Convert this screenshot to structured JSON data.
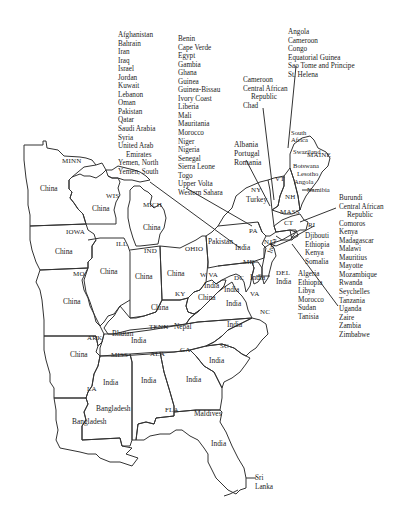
{
  "map": {
    "states": [
      {
        "abbr": "MINN",
        "country": "China"
      },
      {
        "abbr": "WIS",
        "country": "China"
      },
      {
        "abbr": "MICH",
        "country": "China"
      },
      {
        "abbr": "IOWA",
        "country": "China"
      },
      {
        "abbr": "ILL",
        "country": "China"
      },
      {
        "abbr": "IND",
        "country": "China"
      },
      {
        "abbr": "OHIO",
        "country": "China"
      },
      {
        "abbr": "MO",
        "country": "China"
      },
      {
        "abbr": "KY",
        "country": "China"
      },
      {
        "abbr": "ARK",
        "country": "China"
      },
      {
        "abbr": "TENN",
        "country": "Nepal / Bhutan / India"
      },
      {
        "abbr": "MISS",
        "country": "India"
      },
      {
        "abbr": "ALA",
        "country": "India"
      },
      {
        "abbr": "GA",
        "country": "India"
      },
      {
        "abbr": "SC",
        "country": "India"
      },
      {
        "abbr": "NC",
        "country": "India"
      },
      {
        "abbr": "VA",
        "country": "India"
      },
      {
        "abbr": "W VA",
        "country": "India"
      },
      {
        "abbr": "MD",
        "country": "India"
      },
      {
        "abbr": "DC",
        "country": "India"
      },
      {
        "abbr": "DEL",
        "country": "India"
      },
      {
        "abbr": "NJ",
        "country": "India"
      },
      {
        "abbr": "PA",
        "country": "Pakistan / India"
      },
      {
        "abbr": "NY",
        "country": "Turkey"
      },
      {
        "abbr": "VT",
        "country": ""
      },
      {
        "abbr": "NH",
        "country": ""
      },
      {
        "abbr": "MAINE",
        "country": "South Africa / Swaziland / Botswana / Lesotho / Angola"
      },
      {
        "abbr": "MASS",
        "country": ""
      },
      {
        "abbr": "CT",
        "country": ""
      },
      {
        "abbr": "RI",
        "country": ""
      },
      {
        "abbr": "LA",
        "country": "Bangladesh"
      },
      {
        "abbr": "FLA",
        "country": "India / Maldives / Sri Lanka"
      }
    ],
    "state_labels": {
      "minn": "MINN",
      "wis": "WIS",
      "mich": "MICH",
      "iowa": "IOWA",
      "ill": "ILL",
      "ind": "IND",
      "ohio": "OHIO",
      "pa": "PA",
      "ny": "NY",
      "vt": "VT",
      "nh": "NH",
      "maine": "MAINE",
      "mass": "MASS",
      "ct": "CT",
      "ri": "RI",
      "nj": "NJ",
      "del": "DEL",
      "md": "MD",
      "dc": "DC",
      "va": "VA",
      "wva": "W VA",
      "ky": "KY",
      "mo": "MO",
      "tenn": "TENN",
      "nc": "NC",
      "sc": "SC",
      "ga": "GA",
      "ala": "ALA",
      "miss": "MISS",
      "ark": "ARK",
      "la": "LA",
      "fla": "FLA"
    },
    "region_labels": {
      "china_minn": "China",
      "china_wis": "China",
      "china_mich": "China",
      "china_iowa": "China",
      "china_ill": "China",
      "china_ind": "China",
      "china_ohio": "China",
      "china_mo": "China",
      "china_ky": "China",
      "china_ky2": "China",
      "china_ark": "China",
      "pakistan": "Pakistan",
      "india_pa": "India",
      "turkey": "Turkey",
      "india_nj": "India",
      "india_del": "India",
      "india_md": "India",
      "india_wva": "India",
      "india_dc": "India",
      "india_va": "India",
      "india_nc": "India",
      "india_tenn": "India",
      "nepal": "Nepal",
      "bhutan": "Bhutan",
      "india_miss": "India",
      "india_ala": "India",
      "india_ga": "India",
      "india_sc": "India",
      "india_fla": "India",
      "bangladesh_la": "Bangladesh",
      "bangladesh_miss": "Bangladesh",
      "maldives": "Maldives",
      "south_africa": "South\nAfrica",
      "swaziland": "Swaziland",
      "botswana": "Botswana",
      "lesotho": "Lesotho",
      "angola": "Angola",
      "namibia": "Namibia",
      "sri_lanka": "Sri\nLanka"
    },
    "callouts": {
      "middle_east": [
        "Afghanistan",
        "Bahrain",
        "Iran",
        "Iraq",
        "Israel",
        "Jordan",
        "Kuwait",
        "Lebanon",
        "Oman",
        "Pakistan",
        "Qatar",
        "Saudi Arabia",
        "Syria",
        "United Arab",
        "Emirates",
        "Yemen, North",
        "Yemen, South"
      ],
      "west_africa": [
        "Benin",
        "Cape Verde",
        "Egypt",
        "Gambia",
        "Ghana",
        "Guinea",
        "Guinea-Bissau",
        "Ivory Coast",
        "Liberia",
        "Mali",
        "Mauritania",
        "Morocco",
        "Niger",
        "Nigeria",
        "Senegal",
        "Sierra Leone",
        "Togo",
        "Upper Volta",
        "Western Sahara"
      ],
      "central_africa_vt": [
        "Angola",
        "Cameroon",
        "Congo",
        "Equatorial Guinea",
        "Sao Tome and Principe",
        "St. Helena"
      ],
      "central_africa_ny": [
        "Cameroon",
        "Central African",
        "Republic",
        "Chad"
      ],
      "europe": [
        "Albania",
        "Portugal",
        "Romania"
      ],
      "east_africa_mass": [
        "Burundi",
        "Central African",
        "Republic",
        "Comoros",
        "Kenya",
        "Madagascar",
        "Malawi",
        "Mauritius",
        "Mayotte",
        "Mozambique",
        "Rwanda",
        "Seychelles",
        "Tanzania",
        "Uganda",
        "Zaire",
        "Zambia",
        "Zimbabwe"
      ],
      "horn_africa_ri": [
        "Djibouti",
        "Ethiopia",
        "Kenya",
        "Somalia"
      ],
      "north_africa_nj": [
        "Algeria",
        "Ethiopia",
        "Libya",
        "Morocco",
        "Sudan",
        "Tanisia"
      ]
    },
    "colors": {
      "ink": "#2a2a2a",
      "background": "#ffffff"
    }
  }
}
